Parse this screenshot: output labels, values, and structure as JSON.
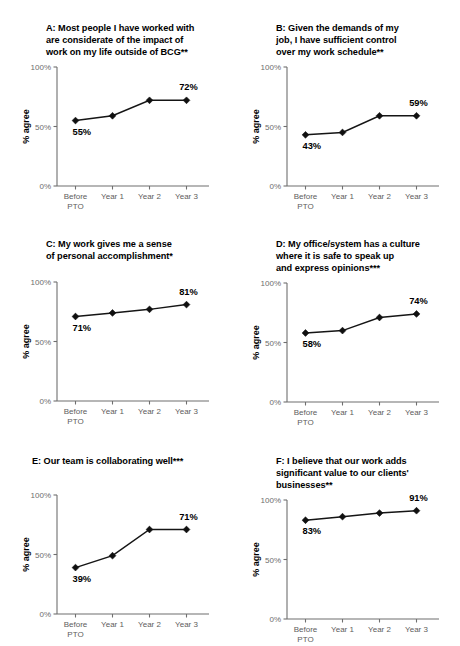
{
  "figure": {
    "categories": [
      "Before\nPTO",
      "Year 1",
      "Year 2",
      "Year 3"
    ],
    "y_axis_label": "% agree",
    "y_ticks": [
      "0%",
      "50%",
      "100%"
    ],
    "y_tick_values": [
      0,
      50,
      100
    ],
    "ylim": [
      0,
      100
    ],
    "background_color": "#ffffff",
    "line_color": "#101010",
    "marker_color": "#101010",
    "axis_color": "#6f6f6f"
  },
  "panels": [
    {
      "id": "A",
      "title": "A: Most people I have worked with\nare considerate of the impact of\nwork on my life outside of BCG**",
      "labels": {
        "first": "55%",
        "last": "72%"
      }
    },
    {
      "id": "B",
      "title": "B: Given the demands of my\njob, I have sufficient control\nover my work schedule**",
      "labels": {
        "first": "43%",
        "last": "59%"
      }
    },
    {
      "id": "C",
      "title": "C: My work gives me a sense\nof personal accomplishment*",
      "labels": {
        "first": "71%",
        "last": "81%"
      }
    },
    {
      "id": "D",
      "title": "D: My office/system has a culture\nwhere it is safe to speak up\nand express opinions***",
      "labels": {
        "first": "58%",
        "last": "74%"
      }
    },
    {
      "id": "E",
      "title": "E:  Our team is collaborating well***",
      "labels": {
        "first": "39%",
        "last": "71%"
      }
    },
    {
      "id": "F",
      "title": "F: I believe that our work adds\nsignificant value to our clients'\nbusinesses**",
      "labels": {
        "first": "83%",
        "last": "91%"
      }
    }
  ],
  "chart_data": [
    {
      "type": "line",
      "panel": "A",
      "title": "A: Most people I have worked with are considerate of the impact of work on my life outside of BCG**",
      "xlabel": "",
      "ylabel": "% agree",
      "categories": [
        "Before PTO",
        "Year 1",
        "Year 2",
        "Year 3"
      ],
      "values": [
        55,
        59,
        72,
        72
      ],
      "point_labels": {
        "Before PTO": "55%",
        "Year 3": "72%"
      },
      "ylim": [
        0,
        100
      ],
      "ytick_labels": [
        "0%",
        "50%",
        "100%"
      ],
      "grid": false,
      "legend": "none",
      "significance": "**"
    },
    {
      "type": "line",
      "panel": "B",
      "title": "B: Given the demands of my job, I have sufficient control over my work schedule**",
      "xlabel": "",
      "ylabel": "% agree",
      "categories": [
        "Before PTO",
        "Year 1",
        "Year 2",
        "Year 3"
      ],
      "values": [
        43,
        45,
        59,
        59
      ],
      "point_labels": {
        "Before PTO": "43%",
        "Year 3": "59%"
      },
      "ylim": [
        0,
        100
      ],
      "ytick_labels": [
        "0%",
        "50%",
        "100%"
      ],
      "grid": false,
      "legend": "none",
      "significance": "**"
    },
    {
      "type": "line",
      "panel": "C",
      "title": "C: My work gives me a sense of personal accomplishment*",
      "xlabel": "",
      "ylabel": "% agree",
      "categories": [
        "Before PTO",
        "Year 1",
        "Year 2",
        "Year 3"
      ],
      "values": [
        71,
        74,
        77,
        81
      ],
      "point_labels": {
        "Before PTO": "71%",
        "Year 3": "81%"
      },
      "ylim": [
        0,
        100
      ],
      "ytick_labels": [
        "0%",
        "50%",
        "100%"
      ],
      "grid": false,
      "legend": "none",
      "significance": "*"
    },
    {
      "type": "line",
      "panel": "D",
      "title": "D: My office/system has a culture where it is safe to speak up and express opinions***",
      "xlabel": "",
      "ylabel": "% agree",
      "categories": [
        "Before PTO",
        "Year 1",
        "Year 2",
        "Year 3"
      ],
      "values": [
        58,
        60,
        71,
        74
      ],
      "point_labels": {
        "Before PTO": "58%",
        "Year 3": "74%"
      },
      "ylim": [
        0,
        100
      ],
      "ytick_labels": [
        "0%",
        "50%",
        "100%"
      ],
      "grid": false,
      "legend": "none",
      "significance": "***"
    },
    {
      "type": "line",
      "panel": "E",
      "title": "E:  Our team is collaborating well***",
      "xlabel": "",
      "ylabel": "% agree",
      "categories": [
        "Before PTO",
        "Year 1",
        "Year 2",
        "Year 3"
      ],
      "values": [
        39,
        49,
        71,
        71
      ],
      "point_labels": {
        "Before PTO": "39%",
        "Year 3": "71%"
      },
      "ylim": [
        0,
        100
      ],
      "ytick_labels": [
        "0%",
        "50%",
        "100%"
      ],
      "grid": false,
      "legend": "none",
      "significance": "***"
    },
    {
      "type": "line",
      "panel": "F",
      "title": "F: I believe that our work adds significant value to our clients' businesses**",
      "xlabel": "",
      "ylabel": "% agree",
      "categories": [
        "Before PTO",
        "Year 1",
        "Year 2",
        "Year 3"
      ],
      "values": [
        83,
        86,
        89,
        91
      ],
      "point_labels": {
        "Before PTO": "83%",
        "Year 3": "91%"
      },
      "ylim": [
        0,
        100
      ],
      "ytick_labels": [
        "0%",
        "50%",
        "100%"
      ],
      "grid": false,
      "legend": "none",
      "significance": "**"
    }
  ]
}
